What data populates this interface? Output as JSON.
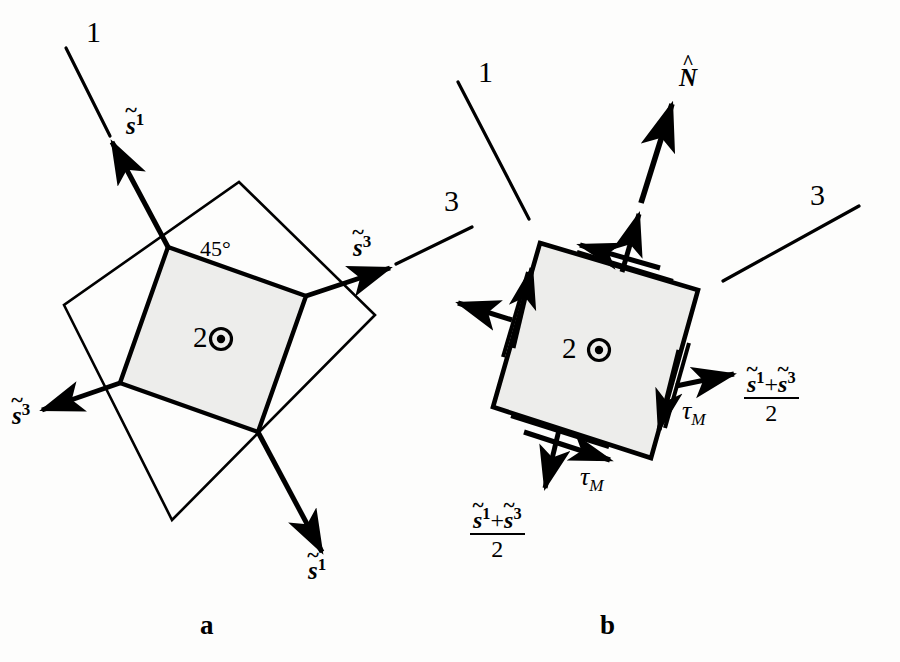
{
  "figure": {
    "background_color": "#fdfdfc",
    "ink_color": "#000000",
    "shaded_fill": "#ededeb",
    "panels": [
      {
        "letter": "a",
        "material_label": "2",
        "angle_label": "45°",
        "axis_lines": [
          "1",
          "3"
        ],
        "vector_labels": [
          "s̃1",
          "s̃3",
          "s̃3",
          "s̃1"
        ]
      },
      {
        "letter": "b",
        "material_label": "2",
        "normal_label": "N̂",
        "axis_lines": [
          "1",
          "3"
        ],
        "shear_labels": [
          "τM",
          "τM"
        ],
        "normal_stress_labels": [
          "(s̃1+s̃3)/2",
          "(s̃1+s̃3)/2"
        ]
      }
    ]
  },
  "panel_a": {
    "axis_1": "1",
    "axis_3": "3",
    "angle": "45°",
    "center_number": "2",
    "vec_s1_upper_base": "s",
    "vec_s1_upper_sup": "1",
    "vec_s3_right_base": "s",
    "vec_s3_right_sup": "3",
    "vec_s3_left_base": "s",
    "vec_s3_left_sup": "3",
    "vec_s1_lower_base": "s",
    "vec_s1_lower_sup": "1",
    "panel_letter": "a"
  },
  "panel_b": {
    "axis_1": "1",
    "axis_3": "3",
    "center_number": "2",
    "normal_base": "N",
    "tau_right_base": "τ",
    "tau_right_sub": "M",
    "tau_bottom_base": "τ",
    "tau_bottom_sub": "M",
    "frac_right_num_s": "s",
    "frac_right_num_sup1": "1",
    "frac_right_num_plus": "+",
    "frac_right_num_sup3": "3",
    "frac_right_den": "2",
    "frac_bottom_num_s": "s",
    "frac_bottom_num_sup1": "1",
    "frac_bottom_num_plus": "+",
    "frac_bottom_num_sup3": "3",
    "frac_bottom_den": "2",
    "panel_letter": "b"
  }
}
